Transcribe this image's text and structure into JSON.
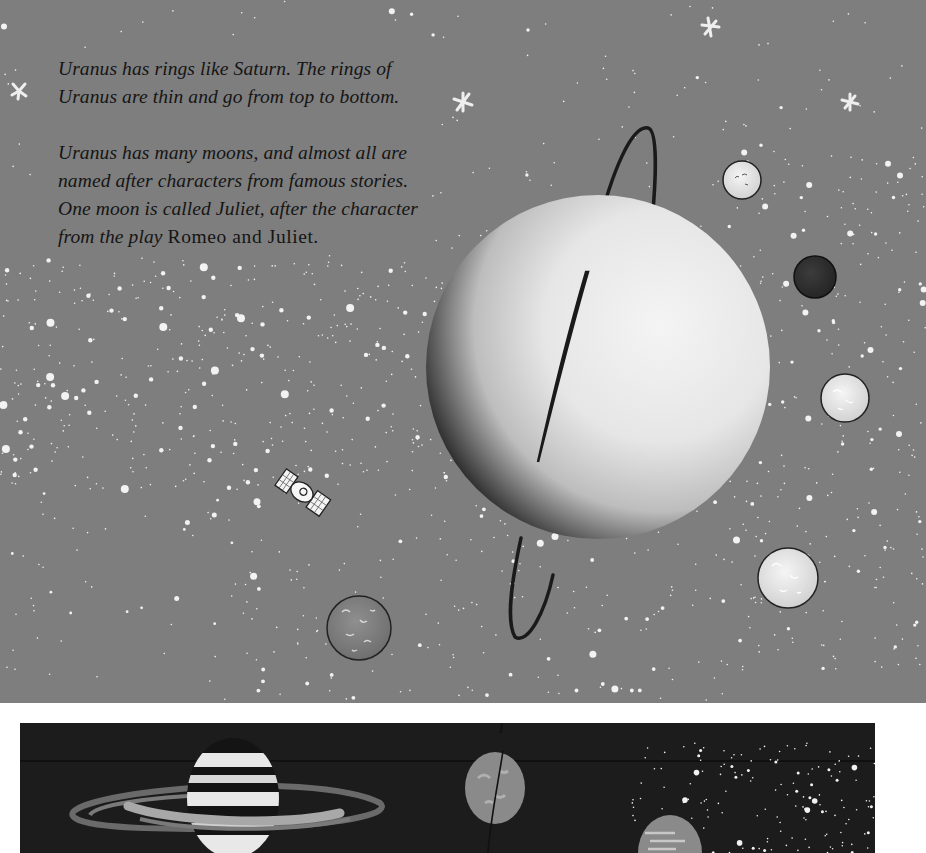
{
  "page": {
    "title": "Uranus",
    "paragraphs": [
      {
        "text": "Uranus has rings like Saturn. The rings of Uranus are thin and go from top to bottom."
      },
      {
        "text_before": "Uranus has many moons, and almost all are named after characters from famous stories. One moon is called Juliet, after the character from the play ",
        "title_ref": "Romeo and Juliet",
        "text_after": "."
      }
    ]
  },
  "illustration": {
    "background_color": "#7e7e7e",
    "bottom_panel_color": "#1c1c1c",
    "main_planet": "uranus",
    "moons": [
      "moon-top-right",
      "moon-dark",
      "moon-middle-right",
      "moon-bottom-right",
      "moon-bottom-left"
    ],
    "objects": [
      "satellite",
      "stars",
      "star-sparkles"
    ],
    "bottom_panel_planets": [
      "saturn",
      "uranus",
      "neptune"
    ]
  }
}
